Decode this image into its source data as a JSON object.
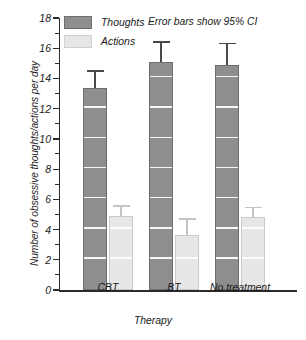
{
  "chart_data": {
    "type": "bar",
    "title": "",
    "subtitle": "",
    "xlabel": "Therapy",
    "ylabel": "Number of obsessive thoughts/actions per day",
    "categories": [
      "CBT",
      "BT",
      "No treatment"
    ],
    "ylim": [
      0,
      18
    ],
    "ytick_step": 2,
    "yticks": [
      "0",
      "2",
      "4",
      "6",
      "8",
      "10",
      "12",
      "14",
      "16",
      "18"
    ],
    "minor_ticks": true,
    "grid": "white horizontal gridlines drawn across bars at every 2 units",
    "legend_position": "top-left inside plot",
    "annotation": "Error bars show 95% CI",
    "error_bar_type": "95% CI",
    "series": [
      {
        "name": "Thoughts",
        "color": "#8e8e8e",
        "values": [
          13.4,
          15.1,
          14.9
        ],
        "err_upper": [
          14.55,
          16.45,
          16.35
        ],
        "err_lower": [
          13.4,
          15.1,
          14.9
        ]
      },
      {
        "name": "Actions",
        "color": "#e7e7e7",
        "values": [
          4.9,
          3.65,
          4.85
        ],
        "err_upper": [
          5.6,
          4.75,
          5.5
        ],
        "err_lower": [
          4.9,
          3.65,
          4.85
        ]
      }
    ]
  },
  "legend": {
    "items": [
      {
        "label": "Thoughts",
        "swatch": "thoughts"
      },
      {
        "label": "Actions",
        "swatch": "actions"
      }
    ]
  },
  "axes": {
    "y_title": "Number of obsessive thoughts/actions per day",
    "x_title": "Therapy"
  },
  "note": {
    "text": "Error bars show 95% CI"
  }
}
